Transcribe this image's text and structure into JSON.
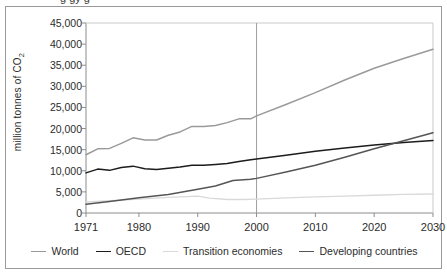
{
  "figure": {
    "clipped_title_fragment": "g                         gy                      g",
    "ylabel_main": "million tonnes of CO",
    "ylabel_sub": "2"
  },
  "legend": {
    "items": [
      {
        "label": "World",
        "color": "#9a9a9a"
      },
      {
        "label": "OECD",
        "color": "#1c1c1c"
      },
      {
        "label": "Transition economies",
        "color": "#d9d9d9"
      },
      {
        "label": "Developing countries",
        "color": "#555555"
      }
    ]
  },
  "chart_data": {
    "type": "line",
    "title": "",
    "xlabel": "",
    "ylabel": "million tonnes of CO2",
    "xlim": [
      1971,
      2030
    ],
    "ylim": [
      0,
      45000
    ],
    "ytick_labels": [
      "45,000",
      "40,000",
      "35,000",
      "30,000",
      "25,000",
      "20,000",
      "15,000",
      "10,000",
      "5,000",
      "0"
    ],
    "ytick_values": [
      45000,
      40000,
      35000,
      30000,
      25000,
      20000,
      15000,
      10000,
      5000,
      0
    ],
    "xtick_labels": [
      "1971",
      "1980",
      "1990",
      "2000",
      "2010",
      "2020",
      "2030"
    ],
    "xtick_values": [
      1971,
      1980,
      1990,
      2000,
      2010,
      2020,
      2030
    ],
    "grid": false,
    "legend_position": "bottom",
    "annotations": [
      {
        "type": "vline",
        "x": 2000,
        "label": "",
        "note": "projection divider at year 2000"
      }
    ],
    "series": [
      {
        "name": "World",
        "color": "#9a9a9a",
        "x": [
          1971,
          1973,
          1975,
          1977,
          1979,
          1981,
          1983,
          1985,
          1987,
          1989,
          1991,
          1993,
          1995,
          1997,
          1999,
          2000,
          2005,
          2010,
          2015,
          2020,
          2025,
          2030
        ],
        "values": [
          13800,
          15200,
          15300,
          16500,
          17800,
          17300,
          17300,
          18400,
          19200,
          20500,
          20500,
          20700,
          21400,
          22300,
          22300,
          23000,
          25700,
          28500,
          31500,
          34300,
          36600,
          38800
        ]
      },
      {
        "name": "OECD",
        "color": "#1c1c1c",
        "x": [
          1971,
          1973,
          1975,
          1977,
          1979,
          1981,
          1983,
          1985,
          1987,
          1989,
          1991,
          1993,
          1995,
          1997,
          1999,
          2000,
          2005,
          2010,
          2015,
          2020,
          2025,
          2030
        ],
        "values": [
          9500,
          10400,
          10100,
          10800,
          11100,
          10500,
          10300,
          10600,
          10900,
          11300,
          11300,
          11500,
          11700,
          12200,
          12600,
          12800,
          13700,
          14600,
          15400,
          16100,
          16700,
          17200
        ]
      },
      {
        "name": "Transition economies",
        "color": "#d9d9d9",
        "x": [
          1971,
          1980,
          1985,
          1990,
          1992,
          1995,
          1998,
          2000,
          2005,
          2010,
          2015,
          2020,
          2025,
          2030
        ],
        "values": [
          2600,
          3300,
          3700,
          4000,
          3500,
          3200,
          3200,
          3300,
          3600,
          3800,
          4000,
          4200,
          4400,
          4500
        ]
      },
      {
        "name": "Developing countries",
        "color": "#555555",
        "x": [
          1971,
          1975,
          1980,
          1985,
          1990,
          1993,
          1996,
          1999,
          2000,
          2005,
          2010,
          2015,
          2020,
          2025,
          2030
        ],
        "values": [
          2100,
          2700,
          3600,
          4400,
          5600,
          6400,
          7700,
          8000,
          8200,
          9700,
          11300,
          13200,
          15200,
          17100,
          19000
        ]
      }
    ]
  }
}
